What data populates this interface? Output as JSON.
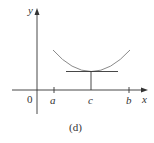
{
  "figure": {
    "caption": "(d)",
    "axes": {
      "x_label": "x",
      "y_label": "y",
      "origin_label": "0"
    },
    "ticks": [
      {
        "label": "a"
      },
      {
        "label": "c"
      },
      {
        "label": "b"
      }
    ]
  },
  "colors": {
    "axis": "#333333",
    "curve": "#8a8a8a",
    "tangent": "#333333"
  }
}
